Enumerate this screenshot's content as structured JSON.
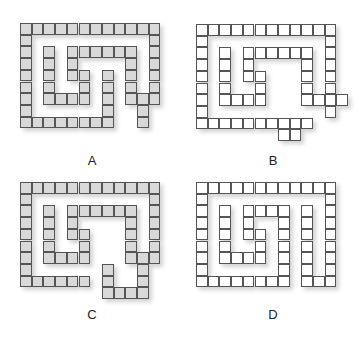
{
  "cell_size": 11.7,
  "figures": [
    {
      "id": "A",
      "label": "A",
      "origin": [
        20,
        23
      ],
      "fill": "filled",
      "label_pos": [
        77,
        153
      ],
      "cells": [
        [
          0,
          0
        ],
        [
          1,
          0
        ],
        [
          2,
          0
        ],
        [
          3,
          0
        ],
        [
          4,
          0
        ],
        [
          5,
          0
        ],
        [
          6,
          0
        ],
        [
          7,
          0
        ],
        [
          8,
          0
        ],
        [
          9,
          0
        ],
        [
          10,
          0
        ],
        [
          11,
          0
        ],
        [
          0,
          1
        ],
        [
          11,
          1
        ],
        [
          0,
          2
        ],
        [
          2,
          2
        ],
        [
          4,
          2
        ],
        [
          5,
          2
        ],
        [
          6,
          2
        ],
        [
          7,
          2
        ],
        [
          8,
          2
        ],
        [
          9,
          2
        ],
        [
          11,
          2
        ],
        [
          0,
          3
        ],
        [
          2,
          3
        ],
        [
          4,
          3
        ],
        [
          9,
          3
        ],
        [
          11,
          3
        ],
        [
          0,
          4
        ],
        [
          2,
          4
        ],
        [
          4,
          4
        ],
        [
          5,
          4
        ],
        [
          7,
          4
        ],
        [
          9,
          4
        ],
        [
          11,
          4
        ],
        [
          0,
          5
        ],
        [
          2,
          5
        ],
        [
          5,
          5
        ],
        [
          7,
          5
        ],
        [
          9,
          5
        ],
        [
          11,
          5
        ],
        [
          0,
          6
        ],
        [
          2,
          6
        ],
        [
          3,
          6
        ],
        [
          4,
          6
        ],
        [
          5,
          6
        ],
        [
          7,
          6
        ],
        [
          9,
          6
        ],
        [
          10,
          6
        ],
        [
          11,
          6
        ],
        [
          0,
          7
        ],
        [
          7,
          7
        ],
        [
          10,
          7
        ],
        [
          0,
          8
        ],
        [
          1,
          8
        ],
        [
          2,
          8
        ],
        [
          3,
          8
        ],
        [
          4,
          8
        ],
        [
          5,
          8
        ],
        [
          6,
          8
        ],
        [
          7,
          8
        ],
        [
          10,
          8
        ]
      ]
    },
    {
      "id": "B",
      "label": "B",
      "origin": [
        196,
        24
      ],
      "fill": "empty",
      "label_pos": [
        258,
        153
      ],
      "cells": [
        [
          0,
          0
        ],
        [
          1,
          0
        ],
        [
          2,
          0
        ],
        [
          3,
          0
        ],
        [
          4,
          0
        ],
        [
          5,
          0
        ],
        [
          6,
          0
        ],
        [
          7,
          0
        ],
        [
          8,
          0
        ],
        [
          9,
          0
        ],
        [
          10,
          0
        ],
        [
          11,
          0
        ],
        [
          0,
          1
        ],
        [
          11,
          1
        ],
        [
          0,
          2
        ],
        [
          2,
          2
        ],
        [
          4,
          2
        ],
        [
          5,
          2
        ],
        [
          6,
          2
        ],
        [
          7,
          2
        ],
        [
          8,
          2
        ],
        [
          9,
          2
        ],
        [
          11,
          2
        ],
        [
          0,
          3
        ],
        [
          2,
          3
        ],
        [
          4,
          3
        ],
        [
          9,
          3
        ],
        [
          11,
          3
        ],
        [
          0,
          4
        ],
        [
          2,
          4
        ],
        [
          4,
          4
        ],
        [
          5,
          4
        ],
        [
          9,
          4
        ],
        [
          11,
          4
        ],
        [
          0,
          5
        ],
        [
          2,
          5
        ],
        [
          5,
          5
        ],
        [
          9,
          5
        ],
        [
          11,
          5
        ],
        [
          0,
          6
        ],
        [
          2,
          6
        ],
        [
          3,
          6
        ],
        [
          4,
          6
        ],
        [
          5,
          6
        ],
        [
          9,
          6
        ],
        [
          10,
          6
        ],
        [
          11,
          6
        ],
        [
          12,
          6
        ],
        [
          0,
          7
        ],
        [
          11,
          7
        ],
        [
          0,
          8
        ],
        [
          1,
          8
        ],
        [
          2,
          8
        ],
        [
          3,
          8
        ],
        [
          4,
          8
        ],
        [
          5,
          8
        ],
        [
          6,
          8
        ],
        [
          7,
          8
        ],
        [
          8,
          8
        ],
        [
          9,
          8
        ],
        [
          7,
          9
        ],
        [
          8,
          9
        ]
      ]
    },
    {
      "id": "C",
      "label": "C",
      "origin": [
        20,
        182
      ],
      "fill": "filled",
      "label_pos": [
        77,
        307
      ],
      "cells": [
        [
          0,
          0
        ],
        [
          1,
          0
        ],
        [
          2,
          0
        ],
        [
          3,
          0
        ],
        [
          4,
          0
        ],
        [
          5,
          0
        ],
        [
          6,
          0
        ],
        [
          7,
          0
        ],
        [
          8,
          0
        ],
        [
          9,
          0
        ],
        [
          10,
          0
        ],
        [
          11,
          0
        ],
        [
          0,
          1
        ],
        [
          11,
          1
        ],
        [
          0,
          2
        ],
        [
          2,
          2
        ],
        [
          4,
          2
        ],
        [
          5,
          2
        ],
        [
          6,
          2
        ],
        [
          7,
          2
        ],
        [
          8,
          2
        ],
        [
          9,
          2
        ],
        [
          11,
          2
        ],
        [
          0,
          3
        ],
        [
          2,
          3
        ],
        [
          4,
          3
        ],
        [
          9,
          3
        ],
        [
          11,
          3
        ],
        [
          0,
          4
        ],
        [
          2,
          4
        ],
        [
          4,
          4
        ],
        [
          5,
          4
        ],
        [
          9,
          4
        ],
        [
          11,
          4
        ],
        [
          0,
          5
        ],
        [
          2,
          5
        ],
        [
          5,
          5
        ],
        [
          9,
          5
        ],
        [
          11,
          5
        ],
        [
          0,
          6
        ],
        [
          2,
          6
        ],
        [
          3,
          6
        ],
        [
          4,
          6
        ],
        [
          5,
          6
        ],
        [
          9,
          6
        ],
        [
          10,
          6
        ],
        [
          11,
          6
        ],
        [
          0,
          7
        ],
        [
          7,
          7
        ],
        [
          10,
          7
        ],
        [
          0,
          8
        ],
        [
          1,
          8
        ],
        [
          2,
          8
        ],
        [
          3,
          8
        ],
        [
          4,
          8
        ],
        [
          5,
          8
        ],
        [
          7,
          8
        ],
        [
          10,
          8
        ],
        [
          7,
          9
        ],
        [
          8,
          9
        ],
        [
          9,
          9
        ],
        [
          10,
          9
        ]
      ]
    },
    {
      "id": "D",
      "label": "D",
      "origin": [
        196,
        182
      ],
      "fill": "empty",
      "label_pos": [
        258,
        307
      ],
      "cells": [
        [
          0,
          0
        ],
        [
          1,
          0
        ],
        [
          2,
          0
        ],
        [
          3,
          0
        ],
        [
          4,
          0
        ],
        [
          5,
          0
        ],
        [
          6,
          0
        ],
        [
          7,
          0
        ],
        [
          8,
          0
        ],
        [
          9,
          0
        ],
        [
          10,
          0
        ],
        [
          11,
          0
        ],
        [
          0,
          1
        ],
        [
          11,
          1
        ],
        [
          0,
          2
        ],
        [
          2,
          2
        ],
        [
          4,
          2
        ],
        [
          5,
          2
        ],
        [
          6,
          2
        ],
        [
          7,
          2
        ],
        [
          9,
          2
        ],
        [
          11,
          2
        ],
        [
          0,
          3
        ],
        [
          2,
          3
        ],
        [
          4,
          3
        ],
        [
          7,
          3
        ],
        [
          9,
          3
        ],
        [
          11,
          3
        ],
        [
          0,
          4
        ],
        [
          2,
          4
        ],
        [
          4,
          4
        ],
        [
          5,
          4
        ],
        [
          7,
          4
        ],
        [
          9,
          4
        ],
        [
          11,
          4
        ],
        [
          0,
          5
        ],
        [
          2,
          5
        ],
        [
          5,
          5
        ],
        [
          7,
          5
        ],
        [
          9,
          5
        ],
        [
          11,
          5
        ],
        [
          0,
          6
        ],
        [
          2,
          6
        ],
        [
          3,
          6
        ],
        [
          4,
          6
        ],
        [
          5,
          6
        ],
        [
          7,
          6
        ],
        [
          9,
          6
        ],
        [
          11,
          6
        ],
        [
          0,
          7
        ],
        [
          7,
          7
        ],
        [
          9,
          7
        ],
        [
          11,
          7
        ],
        [
          0,
          8
        ],
        [
          1,
          8
        ],
        [
          2,
          8
        ],
        [
          3,
          8
        ],
        [
          4,
          8
        ],
        [
          5,
          8
        ],
        [
          6,
          8
        ],
        [
          7,
          8
        ],
        [
          9,
          8
        ],
        [
          10,
          8
        ],
        [
          11,
          8
        ]
      ]
    }
  ]
}
